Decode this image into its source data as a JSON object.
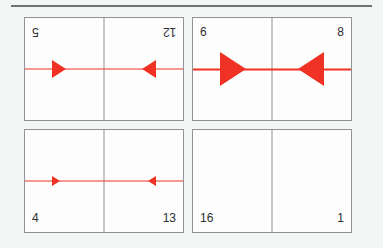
{
  "page": {
    "background_color": "#f4f5f5",
    "rule_color": "#6d7376",
    "card_border_color": "#8d9396",
    "card_fill_color": "#fdfdfd",
    "arrow_color": "#ef3224",
    "number_color": "#2c2f31"
  },
  "cards": [
    {
      "id": "card-top-left",
      "orientation": "rotated-180",
      "left": {
        "number": "5",
        "number_position": "top-left",
        "arrow": {
          "direction": "right",
          "size": "medium"
        }
      },
      "right": {
        "number": "12",
        "number_position": "top-right",
        "arrow": {
          "direction": "left",
          "size": "medium"
        }
      }
    },
    {
      "id": "card-top-right",
      "orientation": "upright",
      "left": {
        "number": "6",
        "number_position": "top-left",
        "arrow": {
          "direction": "right",
          "size": "large"
        }
      },
      "right": {
        "number": "8",
        "number_position": "top-right",
        "arrow": {
          "direction": "left",
          "size": "large"
        }
      }
    },
    {
      "id": "card-bottom-left",
      "orientation": "upright",
      "left": {
        "number": "4",
        "number_position": "bottom-left",
        "arrow": {
          "direction": "right",
          "size": "small"
        }
      },
      "right": {
        "number": "13",
        "number_position": "bottom-right",
        "arrow": {
          "direction": "left",
          "size": "small"
        }
      }
    },
    {
      "id": "card-bottom-right",
      "orientation": "upright",
      "left": {
        "number": "16",
        "number_position": "bottom-left",
        "arrow": null
      },
      "right": {
        "number": "1",
        "number_position": "bottom-right",
        "arrow": null
      }
    }
  ]
}
